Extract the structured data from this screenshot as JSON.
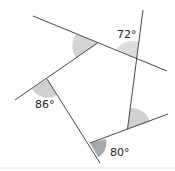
{
  "diagram": {
    "angles": [
      {
        "id": "top-right",
        "label": "72°",
        "value": 72
      },
      {
        "id": "left",
        "label": "86°",
        "value": 86
      },
      {
        "id": "bottom",
        "label": "80°",
        "value": 80
      },
      {
        "id": "top-left",
        "label": "",
        "value": null
      },
      {
        "id": "right",
        "label": "",
        "value": null
      }
    ],
    "colors": {
      "line": "#333333",
      "angle_fill_light": "#d4d4d4",
      "angle_fill_dark": "#a8a8a8",
      "background": "#ffffff"
    }
  }
}
